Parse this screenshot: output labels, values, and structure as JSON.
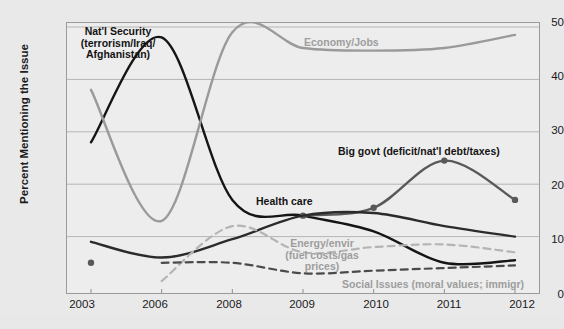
{
  "chart_data": {
    "type": "line",
    "title": "",
    "xlabel": "",
    "ylabel": "Percent Mentioning the Issue",
    "categories": [
      "2003",
      "2006",
      "2008",
      "2009",
      "2010",
      "2011",
      "2012"
    ],
    "ylim": [
      0,
      50
    ],
    "yticks": [
      "0",
      "10",
      "20",
      "30",
      "40",
      "50"
    ],
    "grid": true,
    "legend_position": "inline-annotations",
    "series": [
      {
        "name": "Nat'l Security (terrorism/Iraq/Afghanistan)",
        "color": "#151515",
        "style": "solid",
        "markers": false,
        "values": [
          28,
          48,
          17,
          14,
          11,
          5,
          5.5
        ]
      },
      {
        "name": "Economy/Jobs",
        "color": "#9a9a9a",
        "style": "solid",
        "markers": false,
        "values": [
          38,
          13,
          49,
          46,
          45.5,
          46,
          48.5
        ]
      },
      {
        "name": "Big govt (deficit/nat'l debt/taxes)",
        "color": "#595959",
        "style": "solid",
        "markers": true,
        "values": [
          5,
          null,
          null,
          14,
          15.5,
          24.5,
          17
        ]
      },
      {
        "name": "Health care",
        "color": "#2b2b2b",
        "style": "solid",
        "markers": false,
        "values": [
          9,
          6,
          9.5,
          14,
          14.5,
          12,
          10
        ]
      },
      {
        "name": "Energy/envir (fuel costs/gas prices)",
        "color": "#b4b4b4",
        "style": "dashed",
        "markers": false,
        "values": [
          null,
          1.5,
          12,
          7,
          8,
          8.5,
          7
        ]
      },
      {
        "name": "Social Issues (moral values; immigr)",
        "color": "#4a4a4a",
        "style": "dashed",
        "markers": false,
        "values": [
          null,
          5,
          5,
          3,
          3.5,
          4,
          4.5
        ]
      }
    ],
    "annotations": [
      {
        "id": "natl-security",
        "text_lines": [
          "Nat'l Security",
          "(terrorism/Iraq/",
          "Afghanistan)"
        ],
        "color": "#141414",
        "emphasis": "bold"
      },
      {
        "id": "economy-jobs",
        "text_lines": [
          "Economy/Jobs"
        ],
        "color": "#9d9d9d",
        "emphasis": "bold"
      },
      {
        "id": "big-govt",
        "text_lines": [
          "Big govt (deficit/nat'l debt/taxes)"
        ],
        "color": "#141414",
        "emphasis": "bold"
      },
      {
        "id": "health-care",
        "text_lines": [
          "Health care"
        ],
        "color": "#141414",
        "emphasis": "bold"
      },
      {
        "id": "energy-envir",
        "text_lines": [
          "Energy/envir",
          "(fuel costs/gas",
          "prices)"
        ],
        "color": "#9d9d9d",
        "emphasis": "bold"
      },
      {
        "id": "social-issues",
        "text_lines": [
          "Social Issues (moral values; immigr)"
        ],
        "color": "#9d9d9d",
        "emphasis": "bold"
      }
    ]
  },
  "axis": {
    "y_label": "Percent Mentioning the Issue",
    "y_ticks": {
      "t50": "50",
      "t40": "40",
      "t30": "30",
      "t20": "20",
      "t10": "10",
      "t0": "0"
    },
    "x_ticks": {
      "x0": "2003",
      "x1": "2006",
      "x2": "2008",
      "x3": "2009",
      "x4": "2010",
      "x5": "2011",
      "x6": "2012"
    }
  },
  "labels": {
    "natl_security_l1": "Nat'l Security",
    "natl_security_l2": "(terrorism/Iraq/",
    "natl_security_l3": "Afghanistan)",
    "economy_jobs": "Economy/Jobs",
    "big_govt": "Big govt (deficit/nat'l debt/taxes)",
    "health_care": "Health care",
    "energy_l1": "Energy/envir",
    "energy_l2": "(fuel costs/gas",
    "energy_l3": "prices)",
    "social_issues": "Social Issues (moral values; immigr)"
  }
}
